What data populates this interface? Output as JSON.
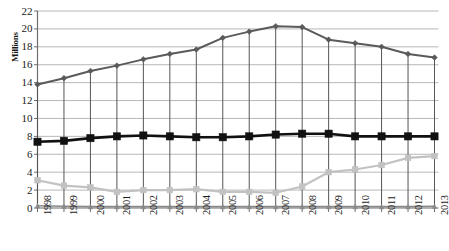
{
  "chart_data": {
    "type": "line",
    "title": "",
    "xlabel": "",
    "ylabel": "Millions",
    "ylim": [
      0,
      22
    ],
    "ytick_step": 2,
    "grid": true,
    "legend": "none",
    "categories": [
      "1998",
      "1999",
      "2000",
      "2001",
      "2002",
      "2003",
      "2004",
      "2005",
      "2006",
      "2007",
      "2008",
      "2009",
      "2010",
      "2011",
      "2012",
      "2013"
    ],
    "series": [
      {
        "name": "dark-gray-diamond-series",
        "color": "#5a5a5a",
        "marker": "diamond",
        "values": [
          13.8,
          14.5,
          15.3,
          15.9,
          16.6,
          17.2,
          17.7,
          19.0,
          19.7,
          20.3,
          20.2,
          18.8,
          18.4,
          18.0,
          17.2,
          16.8
        ]
      },
      {
        "name": "black-square-series",
        "color": "#111111",
        "marker": "square",
        "values": [
          7.4,
          7.5,
          7.8,
          8.0,
          8.1,
          8.0,
          7.9,
          7.9,
          8.0,
          8.2,
          8.3,
          8.3,
          8.0,
          8.0,
          8.0,
          8.0
        ]
      },
      {
        "name": "light-gray-square-series",
        "color": "#c2c2c2",
        "marker": "square",
        "values": [
          3.1,
          2.5,
          2.3,
          1.8,
          2.0,
          2.0,
          2.1,
          1.8,
          1.8,
          1.7,
          2.4,
          4.0,
          4.3,
          4.8,
          5.6,
          5.8
        ]
      },
      {
        "name": "baseline-gray-series",
        "color": "#8a8a8a",
        "marker": "triangle",
        "values": [
          0.25,
          0.2,
          0.15,
          0.15,
          0.15,
          0.15,
          0.15,
          0.15,
          0.15,
          0.15,
          0.15,
          0.15,
          0.15,
          0.15,
          0.15,
          0.2
        ]
      }
    ],
    "yticks": [
      "0",
      "2",
      "4",
      "6",
      "8",
      "10",
      "12",
      "14",
      "16",
      "18",
      "20",
      "22"
    ],
    "dropline_series": "dark-gray-diamond-series"
  },
  "axis": {
    "y_title": "Millions"
  }
}
